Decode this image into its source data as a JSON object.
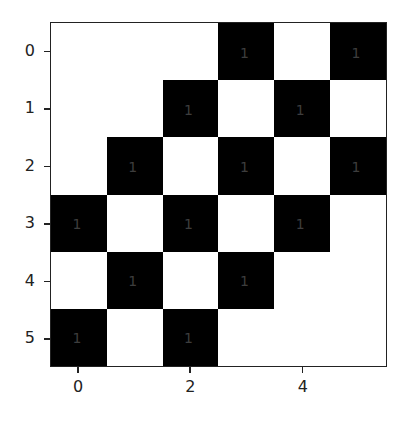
{
  "chart_data": {
    "type": "heatmap",
    "title": "",
    "xlabel": "",
    "ylabel": "",
    "colormap": "binary (0 = white, 1 = black)",
    "rows": 6,
    "cols": 6,
    "x_ticks": [
      "0",
      "2",
      "4"
    ],
    "y_ticks": [
      "0",
      "1",
      "2",
      "3",
      "4",
      "5"
    ],
    "matrix": [
      [
        0,
        0,
        0,
        1,
        0,
        1
      ],
      [
        0,
        0,
        1,
        0,
        1,
        0
      ],
      [
        0,
        1,
        0,
        1,
        0,
        1
      ],
      [
        1,
        0,
        1,
        0,
        1,
        0
      ],
      [
        0,
        1,
        0,
        1,
        0,
        0
      ],
      [
        1,
        0,
        1,
        0,
        0,
        0
      ]
    ],
    "annotation_text_for_ones": "1",
    "annotation_color": "#3d3d3d",
    "colors": {
      "zero": "#ffffff",
      "one": "#000000"
    },
    "grid": false,
    "legend": false
  }
}
